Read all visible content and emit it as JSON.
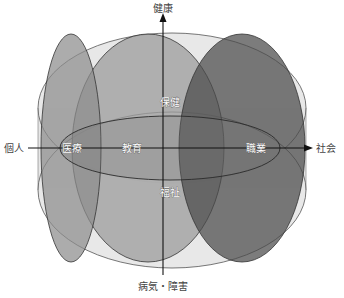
{
  "diagram": {
    "axes": {
      "top": "健康",
      "bottom": "病気・障害",
      "left": "個人",
      "right": "社会"
    },
    "regions": {
      "medical": "医療",
      "education": "教育",
      "vocation": "職業",
      "health_care": "保健",
      "welfare": "福祉"
    },
    "colors": {
      "outer_fill": "#e6e6e6",
      "medical_fill": "#9a9a9a",
      "education_fill": "#a8a8a8",
      "vocation_fill": "#5e5e5e",
      "core_fill": "#8a8a8a",
      "outline": "#3a3a3a",
      "axis": "#111111"
    }
  }
}
